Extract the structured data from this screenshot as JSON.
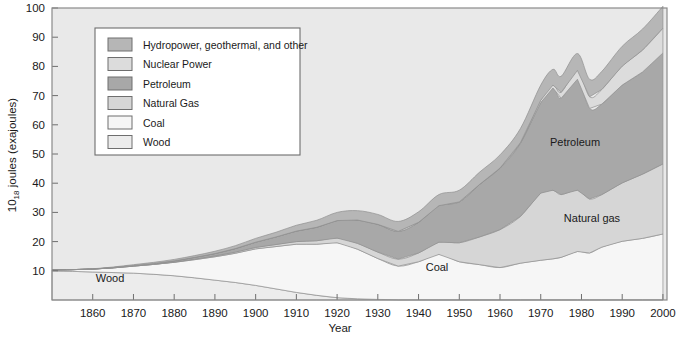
{
  "figure": {
    "background": "#ffffff",
    "plot_background": "#e9e9e9",
    "border_color": "#8a8a8a"
  },
  "axes": {
    "y_title_main": "10",
    "y_title_sub": "18",
    "y_title_rest": " joules (exajoules)",
    "x_title": "Year",
    "y_ticks": [
      "10",
      "20",
      "30",
      "40",
      "50",
      "60",
      "70",
      "80",
      "90",
      "100"
    ],
    "x_ticks": [
      "1860",
      "1870",
      "1880",
      "1890",
      "1900",
      "1910",
      "1920",
      "1930",
      "1940",
      "1950",
      "1960",
      "1970",
      "1980",
      "1990",
      "2000"
    ]
  },
  "legend": {
    "items": [
      {
        "label": "Hydropower, geothermal, and other",
        "color": "#b6b6b6"
      },
      {
        "label": "Nuclear Power",
        "color": "#dcdcdc"
      },
      {
        "label": "Petroleum",
        "color": "#a8a8a8"
      },
      {
        "label": "Natural Gas",
        "color": "#d6d6d6"
      },
      {
        "label": "Coal",
        "color": "#f6f6f6"
      },
      {
        "label": "Wood",
        "color": "#ececec"
      }
    ]
  },
  "series_labels": [
    {
      "name": "petroleum-label",
      "text": "Petroleum"
    },
    {
      "name": "natural-gas-label",
      "text": "Natural gas"
    },
    {
      "name": "coal-label",
      "text": "Coal"
    },
    {
      "name": "wood-label",
      "text": "Wood"
    }
  ],
  "chart_data": {
    "type": "area",
    "stacked": true,
    "title": "",
    "xlabel": "Year",
    "ylabel": "10^18 joules (exajoules)",
    "xlim": [
      1850,
      2001
    ],
    "ylim": [
      0,
      100
    ],
    "grid": false,
    "legend_position": "upper-left-inset",
    "x": [
      1850,
      1855,
      1860,
      1865,
      1870,
      1875,
      1880,
      1885,
      1890,
      1895,
      1900,
      1905,
      1910,
      1915,
      1920,
      1925,
      1930,
      1935,
      1940,
      1945,
      1950,
      1955,
      1960,
      1965,
      1970,
      1973,
      1975,
      1979,
      1982,
      1985,
      1990,
      1995,
      2000
    ],
    "series": [
      {
        "name": "Wood",
        "color": "#ececec",
        "values": [
          10.0,
          9.8,
          9.6,
          9.4,
          9.2,
          8.8,
          8.3,
          7.6,
          6.8,
          6.0,
          5.0,
          3.8,
          2.6,
          1.6,
          0.8,
          0.4,
          0.2,
          0.1,
          0.1,
          0.1,
          0.1,
          0.1,
          0.1,
          0.1,
          0.1,
          0.1,
          0.1,
          0.1,
          0.1,
          0.1,
          0.1,
          0.1,
          0.1
        ]
      },
      {
        "name": "Coal",
        "color": "#f6f6f6",
        "values": [
          0.3,
          0.6,
          1.0,
          1.6,
          2.4,
          3.4,
          4.6,
          6.2,
          8.0,
          10.0,
          12.5,
          14.5,
          16.5,
          17.5,
          18.8,
          17.0,
          14.0,
          11.5,
          13.0,
          15.5,
          13.0,
          12.0,
          11.0,
          12.5,
          13.5,
          14.0,
          14.5,
          16.5,
          16.0,
          18.0,
          20.0,
          21.0,
          22.5
        ]
      },
      {
        "name": "Natural Gas",
        "color": "#d6d6d6",
        "values": [
          0.0,
          0.0,
          0.0,
          0.0,
          0.0,
          0.0,
          0.1,
          0.2,
          0.3,
          0.4,
          0.5,
          0.7,
          0.9,
          1.2,
          1.6,
          2.0,
          2.2,
          2.4,
          3.0,
          4.2,
          6.5,
          9.5,
          13.0,
          16.0,
          23.0,
          23.5,
          21.5,
          21.0,
          18.5,
          18.0,
          20.0,
          22.0,
          24.0
        ]
      },
      {
        "name": "Petroleum",
        "color": "#a8a8a8",
        "values": [
          0.0,
          0.0,
          0.0,
          0.1,
          0.2,
          0.3,
          0.4,
          0.6,
          0.8,
          1.2,
          1.8,
          2.6,
          3.6,
          4.6,
          6.0,
          8.0,
          9.5,
          9.5,
          10.5,
          12.5,
          14.0,
          18.0,
          21.0,
          25.0,
          31.0,
          35.0,
          33.0,
          38.0,
          31.0,
          31.0,
          33.5,
          35.0,
          38.0
        ]
      },
      {
        "name": "Nuclear Power",
        "color": "#dcdcdc",
        "values": [
          0.0,
          0.0,
          0.0,
          0.0,
          0.0,
          0.0,
          0.0,
          0.0,
          0.0,
          0.0,
          0.0,
          0.0,
          0.0,
          0.0,
          0.0,
          0.0,
          0.0,
          0.0,
          0.0,
          0.0,
          0.0,
          0.0,
          0.1,
          0.3,
          0.8,
          1.0,
          2.0,
          3.0,
          4.0,
          5.0,
          6.5,
          7.5,
          8.5
        ]
      },
      {
        "name": "Hydropower, geothermal, and other",
        "color": "#b6b6b6",
        "values": [
          0.0,
          0.0,
          0.1,
          0.2,
          0.3,
          0.4,
          0.5,
          0.6,
          0.8,
          1.0,
          1.3,
          1.6,
          2.0,
          2.4,
          2.8,
          3.2,
          3.4,
          3.4,
          3.6,
          3.8,
          4.0,
          4.2,
          4.5,
          4.8,
          5.2,
          5.4,
          5.5,
          5.8,
          6.0,
          6.2,
          6.8,
          7.2,
          7.5
        ]
      }
    ],
    "totals_note": "Stacked total rises from ~10 in 1850 to ~96 in 2000"
  }
}
